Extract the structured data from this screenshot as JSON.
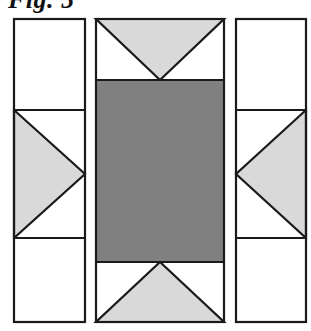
{
  "figure": {
    "caption": "Fig. 5",
    "kind": "technical-line-drawing",
    "background_color": "#ffffff",
    "stroke_color": "#1a1a1a",
    "stroke_width": 2.2,
    "fills": {
      "white": "#ffffff",
      "light_gray": "#d9d9d9",
      "dark_gray": "#808080"
    },
    "panels": [
      {
        "id": "left-panel",
        "label": "Left panel",
        "x": 14,
        "y": 19,
        "width": 71,
        "height": 303,
        "dividers_y": [
          110,
          238
        ],
        "cells": [
          {
            "id": "left-cell-top",
            "fill": "white",
            "shape": "empty"
          },
          {
            "id": "left-cell-middle",
            "fill": "white",
            "shape": "triangle",
            "triangle_direction": "right",
            "triangle_fill": "light_gray"
          },
          {
            "id": "left-cell-bottom",
            "fill": "white",
            "shape": "empty"
          }
        ]
      },
      {
        "id": "center-panel",
        "label": "Center panel",
        "x": 96,
        "y": 19,
        "width": 128,
        "height": 303,
        "dividers_y": [
          80,
          262
        ],
        "cells": [
          {
            "id": "center-cell-top",
            "fill": "white",
            "shape": "triangle",
            "triangle_direction": "down",
            "triangle_fill": "light_gray"
          },
          {
            "id": "center-cell-middle",
            "fill": "dark_gray",
            "shape": "filled-rectangle"
          },
          {
            "id": "center-cell-bottom",
            "fill": "white",
            "shape": "triangle",
            "triangle_direction": "up",
            "triangle_fill": "light_gray"
          }
        ]
      },
      {
        "id": "right-panel",
        "label": "Right panel",
        "x": 236,
        "y": 19,
        "width": 70,
        "height": 303,
        "dividers_y": [
          110,
          238
        ],
        "cells": [
          {
            "id": "right-cell-top",
            "fill": "white",
            "shape": "empty"
          },
          {
            "id": "right-cell-middle",
            "fill": "white",
            "shape": "triangle",
            "triangle_direction": "left",
            "triangle_fill": "light_gray"
          },
          {
            "id": "right-cell-bottom",
            "fill": "white",
            "shape": "empty"
          }
        ]
      }
    ]
  }
}
